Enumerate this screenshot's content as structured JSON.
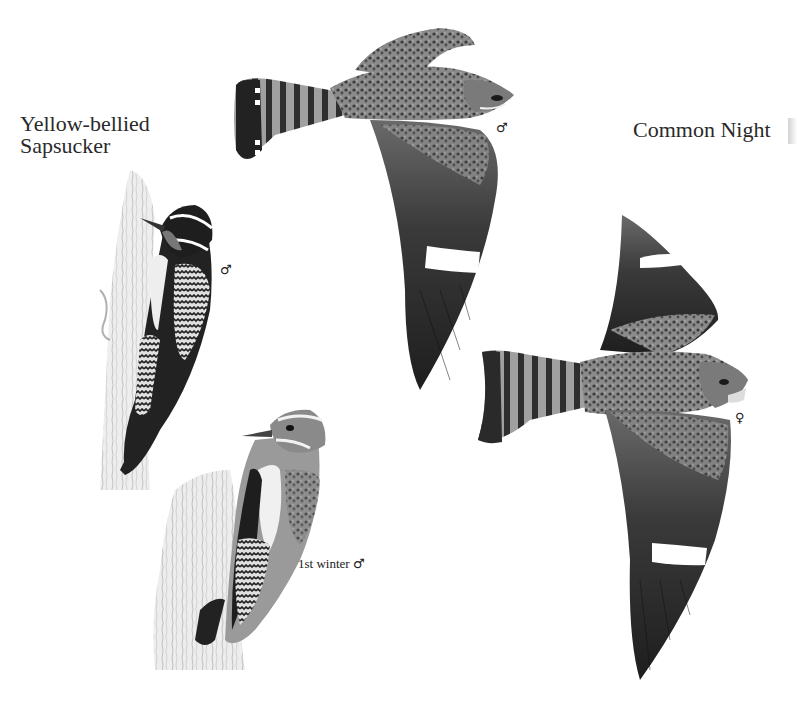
{
  "page": {
    "titles": {
      "sapsucker": [
        "Yellow-bellied",
        "Sapsucker"
      ],
      "nighthawk": "Common Night"
    },
    "figures": [
      {
        "id": "nighthawk-male",
        "species": "Common Nighthawk",
        "sex_symbol": "♂",
        "pose": "flight"
      },
      {
        "id": "nighthawk-female",
        "species": "Common Nighthawk",
        "sex_symbol": "♀",
        "pose": "flight"
      },
      {
        "id": "sapsucker-male",
        "species": "Yellow-bellied Sapsucker",
        "sex_symbol": "♂",
        "pose": "perched on trunk"
      },
      {
        "id": "sapsucker-1st-winter",
        "species": "Yellow-bellied Sapsucker",
        "label": "1st winter",
        "sex_symbol": "♂",
        "pose": "perched on stump"
      }
    ],
    "colors": {
      "background": "#ffffff",
      "ink_dark": "#1e1e1e",
      "ink_mid": "#6a6a6a",
      "ink_light": "#a8a8a8",
      "bark": "#c8c8c8"
    }
  }
}
